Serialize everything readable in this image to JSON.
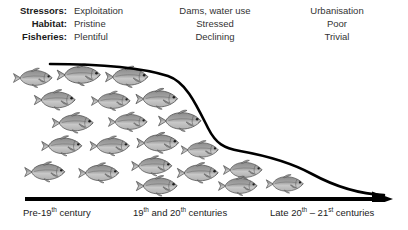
{
  "header": {
    "labels": [
      {
        "key": "Stressors:",
        "values": [
          "Exploitation",
          "Dams, water use",
          "Urbanisation"
        ]
      },
      {
        "key": "Habitat:",
        "values": [
          "Pristine",
          "Stressed",
          "Poor"
        ]
      },
      {
        "key": "Fisheries:",
        "values": [
          "Plentiful",
          "Declining",
          "Trivial"
        ]
      }
    ]
  },
  "axis": {
    "periods": [
      {
        "pre": "Pre-19",
        "sup": "th",
        "post": " century"
      },
      {
        "pre": "19",
        "sup": "th",
        "mid": " and 20",
        "sup2": "th",
        "post": " centuries"
      },
      {
        "pre": "Late 20",
        "sup": "th",
        "mid": " – 21",
        "sup2": "st",
        "post": " centuries"
      }
    ],
    "label_0": "Pre-19th century",
    "label_1": "19th and 20th centuries",
    "label_2": "Late 20th – 21st centuries"
  },
  "chart_data": {
    "type": "area",
    "xlabel": "Time period",
    "ylabel": "Fish abundance",
    "categories": [
      "Pre-19th century",
      "19th and 20th centuries",
      "Late 20th - 21st centuries"
    ],
    "series": [
      {
        "name": "Fish abundance (relative)",
        "values": [
          100,
          45,
          8
        ]
      }
    ],
    "curve_points": [
      {
        "x": 50,
        "y": 13
      },
      {
        "x": 120,
        "y": 15
      },
      {
        "x": 165,
        "y": 20
      },
      {
        "x": 190,
        "y": 40
      },
      {
        "x": 212,
        "y": 78
      },
      {
        "x": 232,
        "y": 95
      },
      {
        "x": 262,
        "y": 101
      },
      {
        "x": 300,
        "y": 112
      },
      {
        "x": 330,
        "y": 130
      },
      {
        "x": 360,
        "y": 140
      },
      {
        "x": 382,
        "y": 143
      }
    ],
    "grid": false,
    "legend": "none",
    "annotations": [
      "Stressors: Exploitation → Dams, water use → Urbanisation",
      "Habitat: Pristine → Stressed → Poor",
      "Fisheries: Plentiful → Declining → Trivial"
    ],
    "fish_count": 31,
    "colors": {
      "curve": "#000000",
      "axis": "#000000",
      "fish_body": "#9a9a9a",
      "fish_outline": "#4a4a4a",
      "text": "#333333"
    }
  },
  "colors": {
    "background": "#ffffff",
    "ink": "#000000",
    "text": "#333333",
    "fish": "#9a9a9a"
  },
  "fish": [
    {
      "x": 33,
      "y": 78,
      "s": 1.0
    },
    {
      "x": 79,
      "y": 75,
      "s": 1.12
    },
    {
      "x": 127,
      "y": 77,
      "s": 1.1
    },
    {
      "x": 55,
      "y": 100,
      "s": 1.06
    },
    {
      "x": 111,
      "y": 101,
      "s": 1.0
    },
    {
      "x": 157,
      "y": 99,
      "s": 1.08
    },
    {
      "x": 73,
      "y": 123,
      "s": 1.06
    },
    {
      "x": 128,
      "y": 122,
      "s": 1.0
    },
    {
      "x": 180,
      "y": 121,
      "s": 1.1
    },
    {
      "x": 62,
      "y": 146,
      "s": 1.04
    },
    {
      "x": 110,
      "y": 146,
      "s": 1.02
    },
    {
      "x": 158,
      "y": 143,
      "s": 1.08
    },
    {
      "x": 200,
      "y": 150,
      "s": 0.96
    },
    {
      "x": 45,
      "y": 172,
      "s": 1.04
    },
    {
      "x": 99,
      "y": 173,
      "s": 1.04
    },
    {
      "x": 152,
      "y": 166,
      "s": 1.04
    },
    {
      "x": 198,
      "y": 173,
      "s": 1.06
    },
    {
      "x": 243,
      "y": 170,
      "s": 1.0
    },
    {
      "x": 157,
      "y": 186,
      "s": 1.06
    },
    {
      "x": 238,
      "y": 186,
      "s": 1.0
    },
    {
      "x": 285,
      "y": 184,
      "s": 0.96
    }
  ]
}
